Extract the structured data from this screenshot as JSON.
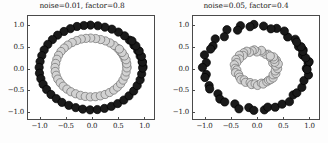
{
  "figure": {
    "background": "#fdfdfd",
    "width": 328,
    "height": 143
  },
  "style": {
    "class0_fill": "#1a1a1a",
    "class0_edge": "#000000",
    "class1_fill": "#d2d2d2",
    "class1_edge": "#6e6e6e",
    "axis_color": "#4a4a4a",
    "text_color": "#1a1a1a",
    "marker_radius_px": 4.2
  },
  "panels": [
    {
      "id": "left",
      "title": "noise=0.01, factor=0.8",
      "noise": 0.01,
      "factor": 0.8
    },
    {
      "id": "right",
      "title": "noise=0.05, factor=0.4",
      "noise": 0.05,
      "factor": 0.4
    }
  ],
  "axis": {
    "xticks": [
      -1.0,
      -0.5,
      0.0,
      0.5,
      1.0
    ],
    "xticklabels": [
      "−1.0",
      "−0.5",
      "0.0",
      "0.5",
      "1.0"
    ],
    "yticks": [
      -1.0,
      -0.5,
      0.0,
      0.5,
      1.0
    ],
    "yticklabels": [
      "−1.0",
      "−0.5",
      "0.0",
      "0.5",
      "1.0"
    ],
    "xlim": [
      -1.22,
      1.22
    ],
    "ylim": [
      -1.22,
      1.22
    ],
    "grid": false
  },
  "chart_data": [
    {
      "type": "scatter",
      "title": "noise=0.01, factor=0.8",
      "xlabel": "",
      "ylabel": "",
      "xlim": [
        -1.22,
        1.22
      ],
      "ylim": [
        -1.22,
        1.22
      ],
      "grid": false,
      "legend": "none",
      "params": {
        "noise": 0.01,
        "factor": 0.8,
        "n_samples": 100
      },
      "series": [
        {
          "name": "outer circle (class 0)",
          "color": "#1a1a1a",
          "radius": 1.0,
          "n_points": 50,
          "x": [
            1.007,
            0.991,
            0.952,
            0.905,
            0.832,
            0.744,
            0.649,
            0.53,
            0.404,
            0.269,
            0.132,
            -0.01,
            -0.139,
            -0.272,
            -0.4,
            -0.524,
            -0.647,
            -0.747,
            -0.836,
            -0.907,
            -0.953,
            -0.986,
            -1.004,
            -0.998,
            -0.971,
            -0.927,
            -0.86,
            -0.775,
            -0.672,
            -0.563,
            -0.43,
            -0.296,
            -0.16,
            -0.018,
            0.122,
            0.261,
            0.394,
            0.517,
            0.636,
            0.736,
            0.827,
            0.894,
            0.951,
            0.981,
            1.002,
            0.997,
            0.978,
            0.933,
            0.869,
            0.793
          ],
          "y": [
            0.015,
            0.134,
            0.27,
            0.399,
            0.527,
            0.65,
            0.752,
            0.839,
            0.908,
            0.955,
            0.989,
            1.004,
            0.995,
            0.972,
            0.92,
            0.853,
            0.766,
            0.663,
            0.548,
            0.416,
            0.281,
            0.14,
            0.002,
            -0.136,
            -0.266,
            -0.397,
            -0.521,
            -0.639,
            -0.738,
            -0.827,
            -0.897,
            -0.95,
            -0.987,
            -1.003,
            -0.996,
            -0.969,
            -0.921,
            -0.855,
            -0.771,
            -0.671,
            -0.556,
            -0.429,
            -0.293,
            -0.152,
            -0.013,
            0.128,
            0.265,
            0.393,
            0.513,
            0.631
          ]
        },
        {
          "name": "inner circle (class 1)",
          "color": "#d2d2d2",
          "radius": 0.8,
          "n_points": 50,
          "x": [
            0.697,
            0.686,
            0.66,
            0.626,
            0.577,
            0.517,
            0.449,
            0.368,
            0.28,
            0.187,
            0.091,
            -0.006,
            -0.097,
            -0.189,
            -0.277,
            -0.364,
            -0.449,
            -0.519,
            -0.581,
            -0.629,
            -0.661,
            -0.684,
            -0.697,
            -0.693,
            -0.674,
            -0.643,
            -0.596,
            -0.538,
            -0.466,
            -0.39,
            -0.298,
            -0.205,
            -0.111,
            -0.013,
            0.085,
            0.181,
            0.273,
            0.359,
            0.441,
            0.511,
            0.574,
            0.62,
            0.659,
            0.68,
            0.695,
            0.692,
            0.679,
            0.647,
            0.603,
            0.55
          ],
          "y": [
            0.01,
            0.093,
            0.187,
            0.277,
            0.366,
            0.451,
            0.522,
            0.582,
            0.63,
            0.662,
            0.686,
            0.697,
            0.69,
            0.674,
            0.638,
            0.592,
            0.531,
            0.46,
            0.38,
            0.288,
            0.195,
            0.097,
            0.001,
            -0.094,
            -0.185,
            -0.275,
            -0.361,
            -0.443,
            -0.512,
            -0.574,
            -0.622,
            -0.659,
            -0.685,
            -0.696,
            -0.691,
            -0.672,
            -0.639,
            -0.593,
            -0.535,
            -0.465,
            -0.386,
            -0.298,
            -0.203,
            -0.106,
            -0.009,
            0.089,
            0.184,
            0.273,
            0.356,
            0.438
          ]
        }
      ]
    },
    {
      "type": "scatter",
      "title": "noise=0.05, factor=0.4",
      "xlabel": "",
      "ylabel": "",
      "xlim": [
        -1.22,
        1.22
      ],
      "ylim": [
        -1.22,
        1.22
      ],
      "grid": false,
      "legend": "none",
      "params": {
        "noise": 0.05,
        "factor": 0.4,
        "n_samples": 100
      },
      "series": [
        {
          "name": "outer circle (class 0)",
          "color": "#1a1a1a",
          "radius": 1.0,
          "n_points": 50,
          "x": [
            0.975,
            1.01,
            0.901,
            0.913,
            0.824,
            0.76,
            0.614,
            0.548,
            0.401,
            0.288,
            0.147,
            -0.04,
            -0.116,
            -0.301,
            -0.357,
            -0.563,
            -0.613,
            -0.789,
            -0.833,
            -0.879,
            -0.998,
            -0.962,
            -1.037,
            -0.963,
            -0.989,
            -0.908,
            -0.897,
            -0.737,
            -0.7,
            -0.605,
            -0.409,
            -0.33,
            -0.139,
            -0.042,
            0.162,
            0.229,
            0.372,
            0.506,
            0.648,
            0.72,
            0.791,
            0.888,
            0.929,
            1.016,
            0.99,
            1.029,
            0.962,
            0.906,
            0.874,
            0.788
          ],
          "y": [
            -0.019,
            0.105,
            0.297,
            0.417,
            0.497,
            0.669,
            0.723,
            0.864,
            0.926,
            0.917,
            0.982,
            1.02,
            0.966,
            0.99,
            0.884,
            0.895,
            0.729,
            0.677,
            0.51,
            0.437,
            0.299,
            0.117,
            0.001,
            -0.165,
            -0.237,
            -0.429,
            -0.509,
            -0.623,
            -0.747,
            -0.817,
            -0.863,
            -0.979,
            -0.948,
            -1.016,
            -1.004,
            -0.939,
            -0.941,
            -0.869,
            -0.81,
            -0.65,
            -0.599,
            -0.471,
            -0.308,
            -0.179,
            -0.049,
            0.137,
            0.228,
            0.382,
            0.492,
            0.6
          ]
        },
        {
          "name": "inner circle (class 1)",
          "color": "#d2d2d2",
          "radius": 0.4,
          "n_points": 50,
          "x": [
            0.383,
            0.402,
            0.324,
            0.394,
            0.333,
            0.276,
            0.234,
            0.185,
            0.118,
            0.105,
            0.016,
            -0.031,
            -0.075,
            -0.127,
            -0.18,
            -0.238,
            -0.248,
            -0.321,
            -0.321,
            -0.389,
            -0.374,
            -0.42,
            -0.405,
            -0.372,
            -0.397,
            -0.337,
            -0.318,
            -0.292,
            -0.228,
            -0.203,
            -0.114,
            -0.085,
            -0.017,
            0.03,
            0.104,
            0.139,
            0.21,
            0.244,
            0.281,
            0.331,
            0.331,
            0.384,
            0.373,
            0.418,
            0.386,
            0.432,
            0.365,
            0.353,
            0.34,
            0.277
          ],
          "y": [
            0.02,
            0.077,
            0.107,
            0.175,
            0.215,
            0.239,
            0.314,
            0.313,
            0.366,
            0.406,
            0.368,
            0.418,
            0.394,
            0.357,
            0.386,
            0.349,
            0.287,
            0.291,
            0.204,
            0.191,
            0.116,
            0.065,
            -0.019,
            -0.057,
            -0.122,
            -0.161,
            -0.228,
            -0.291,
            -0.294,
            -0.351,
            -0.357,
            -0.404,
            -0.386,
            -0.425,
            -0.371,
            -0.392,
            -0.339,
            -0.303,
            -0.289,
            -0.248,
            -0.173,
            -0.144,
            -0.081,
            -0.027,
            0.035,
            0.085,
            0.123,
            0.194,
            0.252,
            0.271
          ]
        }
      ]
    }
  ]
}
